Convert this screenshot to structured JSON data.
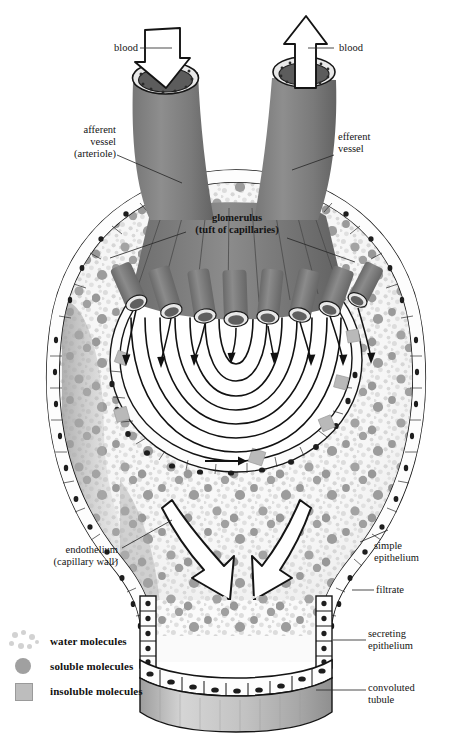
{
  "figure": {
    "background": "#ffffff",
    "colors": {
      "vessel_gray": "#8a8a8a",
      "vessel_dark": "#6f6f6f",
      "filtrate_bg": "#fbfbfb",
      "water_dot": "#d4d4d4",
      "soluble_dot": "#9a9a9a",
      "insoluble_square": "#b9b9b9",
      "outline": "#151515",
      "tubule_fill": "#c9c9c9"
    }
  },
  "labels": {
    "blood_in": "blood",
    "blood_out": "blood",
    "afferent": "afferent\nvessel\n(arteriole)",
    "efferent": "efferent\nvessel",
    "glomerulus": "glomerulus\n(tuft of capillaries)",
    "endothelium": "endothelium\n(capillary wall)",
    "simple_epithelium": "simple\nepithelium",
    "filtrate": "filtrate",
    "secreting_epithelium": "secreting\nepithelium",
    "convoluted_tubule": "convoluted\ntubule"
  },
  "legend": {
    "items": [
      {
        "symbol": "scattered-dots",
        "label": "water molecules"
      },
      {
        "symbol": "filled-circle",
        "label": "soluble molecules"
      },
      {
        "symbol": "filled-square",
        "label": "insoluble molecules"
      }
    ]
  },
  "flow": {
    "afferent_arrow": "down-into-vessel",
    "efferent_arrow": "up-out-of-vessel",
    "capillary_arrows": 8,
    "filtrate_arrows": 2,
    "capsule_arrow": "right"
  }
}
